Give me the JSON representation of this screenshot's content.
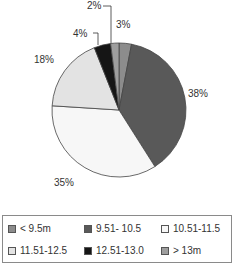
{
  "chart_data": {
    "type": "pie",
    "title": "",
    "categories": [
      "< 9.5m",
      "9.51- 10.5",
      "10.51-11.5",
      "11.51-12.5",
      "12.51-13.0",
      "> 13m"
    ],
    "values": [
      3,
      38,
      35,
      18,
      4,
      2
    ],
    "labels": [
      "3%",
      "38%",
      "35%",
      "18%",
      "4%",
      "2%"
    ],
    "colors": [
      "#8c8c8c",
      "#595959",
      "#f7f7f7",
      "#e3e3e3",
      "#151515",
      "#9e9e9e"
    ],
    "start_angle": "top, clockwise",
    "legend_position": "bottom"
  },
  "labels": {
    "l0": "3%",
    "l1": "38%",
    "l2": "35%",
    "l3": "18%",
    "l4": "4%",
    "l5": "2%"
  },
  "legend": [
    {
      "label": "< 9.5m",
      "color": "#8c8c8c"
    },
    {
      "label": "9.51- 10.5",
      "color": "#595959"
    },
    {
      "label": "10.51-11.5",
      "color": "#f7f7f7"
    },
    {
      "label": "11.51-12.5",
      "color": "#e3e3e3"
    },
    {
      "label": "12.51-13.0",
      "color": "#151515"
    },
    {
      "label": "> 13m",
      "color": "#9e9e9e"
    }
  ]
}
